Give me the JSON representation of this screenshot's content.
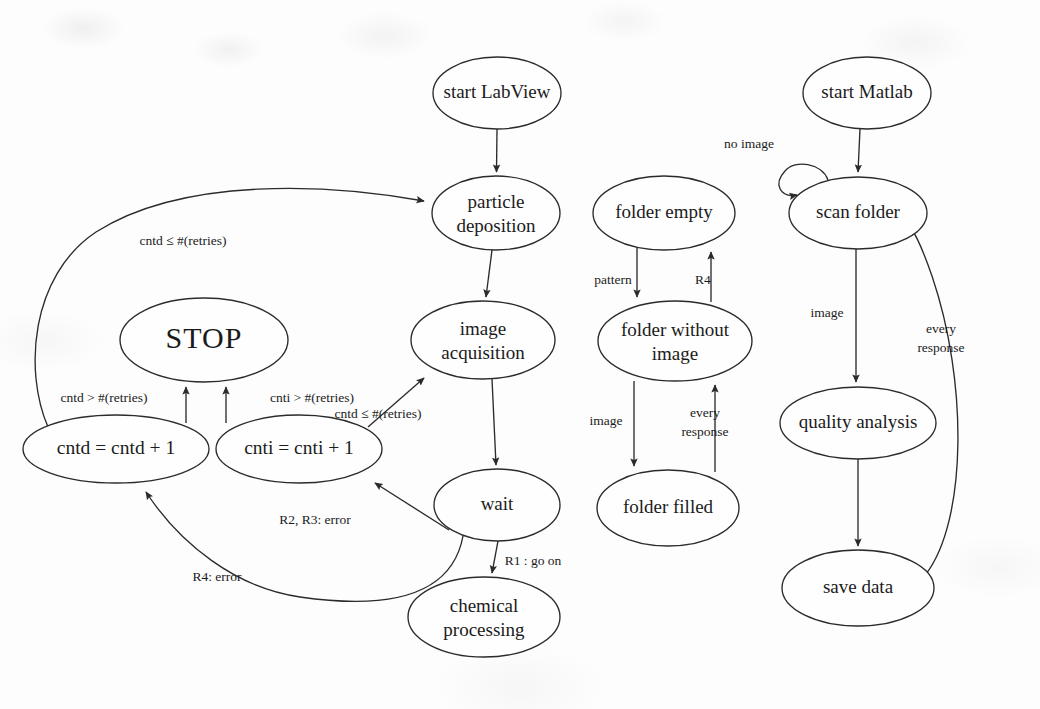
{
  "diagram": {
    "title": "",
    "style": {
      "node_stroke": "#2b2b2b",
      "node_fill": "#fefefe",
      "text_color": "#1b1b1b",
      "background": "#fdfdfd"
    },
    "columns": [
      {
        "name": "labview-process"
      },
      {
        "name": "folder-state"
      },
      {
        "name": "matlab-process"
      }
    ],
    "nodes": [
      {
        "id": "start-labview",
        "label": "start LabView",
        "cx": 497,
        "cy": 93,
        "rx": 64,
        "ry": 36,
        "lines": [
          "start LabView"
        ]
      },
      {
        "id": "particle-deposition",
        "label": "particle deposition",
        "cx": 496,
        "cy": 213,
        "rx": 64,
        "ry": 37,
        "lines": [
          "particle",
          "deposition"
        ]
      },
      {
        "id": "image-acquisition",
        "label": "image acquisition",
        "cx": 483,
        "cy": 340,
        "rx": 72,
        "ry": 39,
        "lines": [
          "image",
          "acquisition"
        ]
      },
      {
        "id": "wait",
        "label": "wait",
        "cx": 497,
        "cy": 505,
        "rx": 63,
        "ry": 36,
        "lines": [
          "wait"
        ]
      },
      {
        "id": "chemical-processing",
        "label": "chemical processing",
        "cx": 484,
        "cy": 617,
        "rx": 76,
        "ry": 40,
        "lines": [
          "chemical",
          "processing"
        ]
      },
      {
        "id": "stop",
        "label": "STOP",
        "cx": 204,
        "cy": 340,
        "rx": 84,
        "ry": 42,
        "lines": [
          "STOP"
        ]
      },
      {
        "id": "cntd-increment",
        "label": "cntd = cntd + 1",
        "cx": 116,
        "cy": 449,
        "rx": 93,
        "ry": 34,
        "lines": [
          "cntd = cntd + 1"
        ]
      },
      {
        "id": "cnti-increment",
        "label": "cnti = cnti + 1",
        "cx": 299,
        "cy": 449,
        "rx": 83,
        "ry": 34,
        "lines": [
          "cnti = cnti + 1"
        ]
      },
      {
        "id": "folder-empty",
        "label": "folder empty",
        "cx": 664,
        "cy": 213,
        "rx": 71,
        "ry": 37,
        "lines": [
          "folder empty"
        ]
      },
      {
        "id": "folder-without-image",
        "label": "folder without image",
        "cx": 675,
        "cy": 341,
        "rx": 77,
        "ry": 40,
        "lines": [
          "folder without",
          "image"
        ]
      },
      {
        "id": "folder-filled",
        "label": "folder filled",
        "cx": 668,
        "cy": 508,
        "rx": 71,
        "ry": 38,
        "lines": [
          "folder filled"
        ]
      },
      {
        "id": "start-matlab",
        "label": "start Matlab",
        "cx": 867,
        "cy": 93,
        "rx": 64,
        "ry": 36,
        "lines": [
          "start Matlab"
        ]
      },
      {
        "id": "scan-folder",
        "label": "scan folder",
        "cx": 858,
        "cy": 213,
        "rx": 69,
        "ry": 36,
        "lines": [
          "scan folder"
        ]
      },
      {
        "id": "quality-analysis",
        "label": "quality analysis",
        "cx": 858,
        "cy": 423,
        "rx": 78,
        "ry": 36,
        "lines": [
          "quality analysis"
        ]
      },
      {
        "id": "save-data",
        "label": "save data",
        "cx": 858,
        "cy": 588,
        "rx": 76,
        "ry": 38,
        "lines": [
          "save data"
        ]
      }
    ],
    "edges": [
      {
        "id": "e-start-to-deposition",
        "from": "start-labview",
        "to": "particle-deposition",
        "label": ""
      },
      {
        "id": "e-deposition-to-image",
        "from": "particle-deposition",
        "to": "image-acquisition",
        "label": ""
      },
      {
        "id": "e-image-to-wait",
        "from": "image-acquisition",
        "to": "wait",
        "label": ""
      },
      {
        "id": "e-wait-to-chemical",
        "from": "wait",
        "to": "chemical-processing",
        "label": "R1 : go on"
      },
      {
        "id": "e-wait-to-cnti",
        "from": "wait",
        "to": "cnti-increment",
        "label": "R2, R3: error"
      },
      {
        "id": "e-wait-to-cntd",
        "from": "wait",
        "to": "cntd-increment",
        "label": "R4: error"
      },
      {
        "id": "e-cntd-to-stop",
        "from": "cntd-increment",
        "to": "stop",
        "label": "cntd > #(retries)"
      },
      {
        "id": "e-cnti-to-stop",
        "from": "cnti-increment",
        "to": "stop",
        "label": "cnti > #(retries)"
      },
      {
        "id": "e-cnti-to-image",
        "from": "cnti-increment",
        "to": "image-acquisition",
        "label": "cntd ≤ #(retries)"
      },
      {
        "id": "e-cntd-to-deposition",
        "from": "cntd-increment",
        "to": "particle-deposition",
        "label": "cntd ≤ #(retries)"
      },
      {
        "id": "e-empty-to-without",
        "from": "folder-empty",
        "to": "folder-without-image",
        "label": "pattern"
      },
      {
        "id": "e-without-to-empty",
        "from": "folder-without-image",
        "to": "folder-empty",
        "label": "R4"
      },
      {
        "id": "e-without-to-filled",
        "from": "folder-without-image",
        "to": "folder-filled",
        "label": "image"
      },
      {
        "id": "e-filled-to-without",
        "from": "folder-filled",
        "to": "folder-without-image",
        "label": "every response"
      },
      {
        "id": "e-matlab-to-scan",
        "from": "start-matlab",
        "to": "scan-folder",
        "label": ""
      },
      {
        "id": "e-scan-self-loop",
        "from": "scan-folder",
        "to": "scan-folder",
        "label": "no image"
      },
      {
        "id": "e-scan-to-quality",
        "from": "scan-folder",
        "to": "quality-analysis",
        "label": "image"
      },
      {
        "id": "e-quality-to-save",
        "from": "quality-analysis",
        "to": "save-data",
        "label": ""
      },
      {
        "id": "e-save-to-scan",
        "from": "save-data",
        "to": "scan-folder",
        "label": "every response"
      }
    ],
    "edge_labels": {
      "cntd_le_retries_top": {
        "text": "cntd ≤ #(retries)",
        "x": 183,
        "y": 242
      },
      "cntd_gt_retries": {
        "text": "cntd > #(retries)",
        "x": 104,
        "y": 399
      },
      "cnti_gt_retries": {
        "text": "cnti > #(retries)",
        "x": 312,
        "y": 399
      },
      "cntd_le_retries_mid": {
        "text": "cntd ≤ #(retries)",
        "x": 378,
        "y": 415
      },
      "r2_r3_error": {
        "text": "R2, R3: error",
        "x": 315,
        "y": 521
      },
      "r4_error": {
        "text": "R4: error",
        "x": 217,
        "y": 578
      },
      "r1_go_on": {
        "text": "R1 : go on",
        "x": 533,
        "y": 562
      },
      "pattern": {
        "text": "pattern",
        "x": 613,
        "y": 281
      },
      "r4": {
        "text": "R4",
        "x": 703,
        "y": 281
      },
      "image_mid": {
        "text": "image",
        "x": 606,
        "y": 422
      },
      "every_response_mid": {
        "text": "every\nresponse",
        "x": 705,
        "y": 423,
        "line1": "every",
        "line2": "response"
      },
      "no_image": {
        "text": "no image",
        "x": 749,
        "y": 145
      },
      "image_right": {
        "text": "image",
        "x": 827,
        "y": 314
      },
      "every_response_right": {
        "text": "every\nresponse",
        "x": 941,
        "y": 339,
        "line1": "every",
        "line2": "response"
      }
    }
  }
}
